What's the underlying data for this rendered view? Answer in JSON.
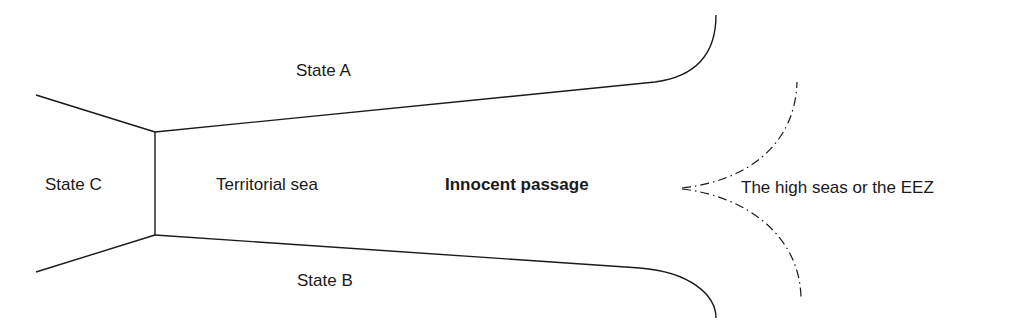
{
  "diagram": {
    "labels": {
      "state_a": "State A",
      "state_b": "State B",
      "state_c": "State C",
      "territorial_sea": "Territorial sea",
      "innocent_passage": "Innocent passage",
      "high_seas": "The high seas or the EEZ"
    },
    "colors": {
      "line": "#1a1a1a",
      "background": "#ffffff"
    }
  }
}
